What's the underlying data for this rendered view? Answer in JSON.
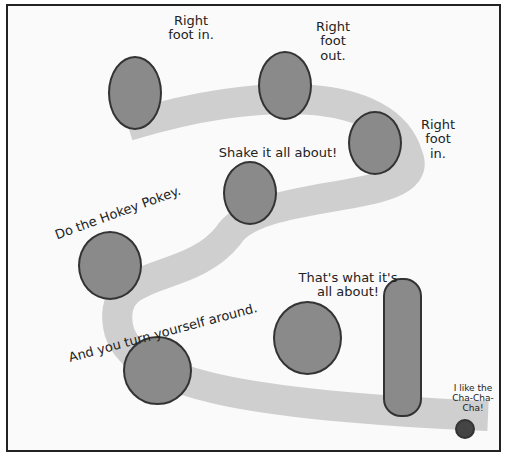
{
  "captions": {
    "c1": "Right foot in.",
    "c2": "Right foot out.",
    "c3": "Right foot in.",
    "c4": "Shake it all about!",
    "c5": "Do the Hokey Pokey.",
    "c6": "That's what it's all about!",
    "c7": "And you turn yourself around.",
    "c8": "I like the Cha-Cha-Cha!"
  }
}
